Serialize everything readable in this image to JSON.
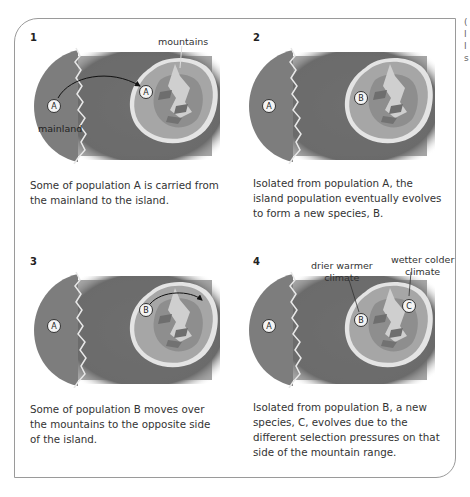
{
  "colors": {
    "sea": "#6f6f6f",
    "mainland": "#7d7d7d",
    "island_outer": "#a8a8a8",
    "island_inner": "#8c8c8c",
    "mountain": "#c8c8c8",
    "coast": "#e6e6e6",
    "marker_fill": "#f2f2f2",
    "marker_stroke": "#333333"
  },
  "edge_text": "( I I s",
  "panels": [
    {
      "number": "1",
      "labels": {
        "mountains": "mountains",
        "mainland": "mainland"
      },
      "markers": {
        "mainland": "A",
        "island": "A"
      },
      "caption": "Some of population A is carried from the mainland to the island."
    },
    {
      "number": "2",
      "markers": {
        "mainland": "A",
        "island": "B"
      },
      "caption": "Isolated from population A, the island population eventually evolves to form a new species, B."
    },
    {
      "number": "3",
      "markers": {
        "mainland": "A",
        "island": "B"
      },
      "caption": "Some of population B moves over the mountains to the opposite side of the island."
    },
    {
      "number": "4",
      "labels": {
        "dry_line1": "drier warmer",
        "dry_line2": "climate",
        "wet_line1": "wetter colder",
        "wet_line2": "climate"
      },
      "markers": {
        "mainland": "A",
        "island": "B",
        "island2": "C"
      },
      "caption": "Isolated from population B, a new species, C, evolves due to the different selection pressures on that side of the mountain range."
    }
  ]
}
